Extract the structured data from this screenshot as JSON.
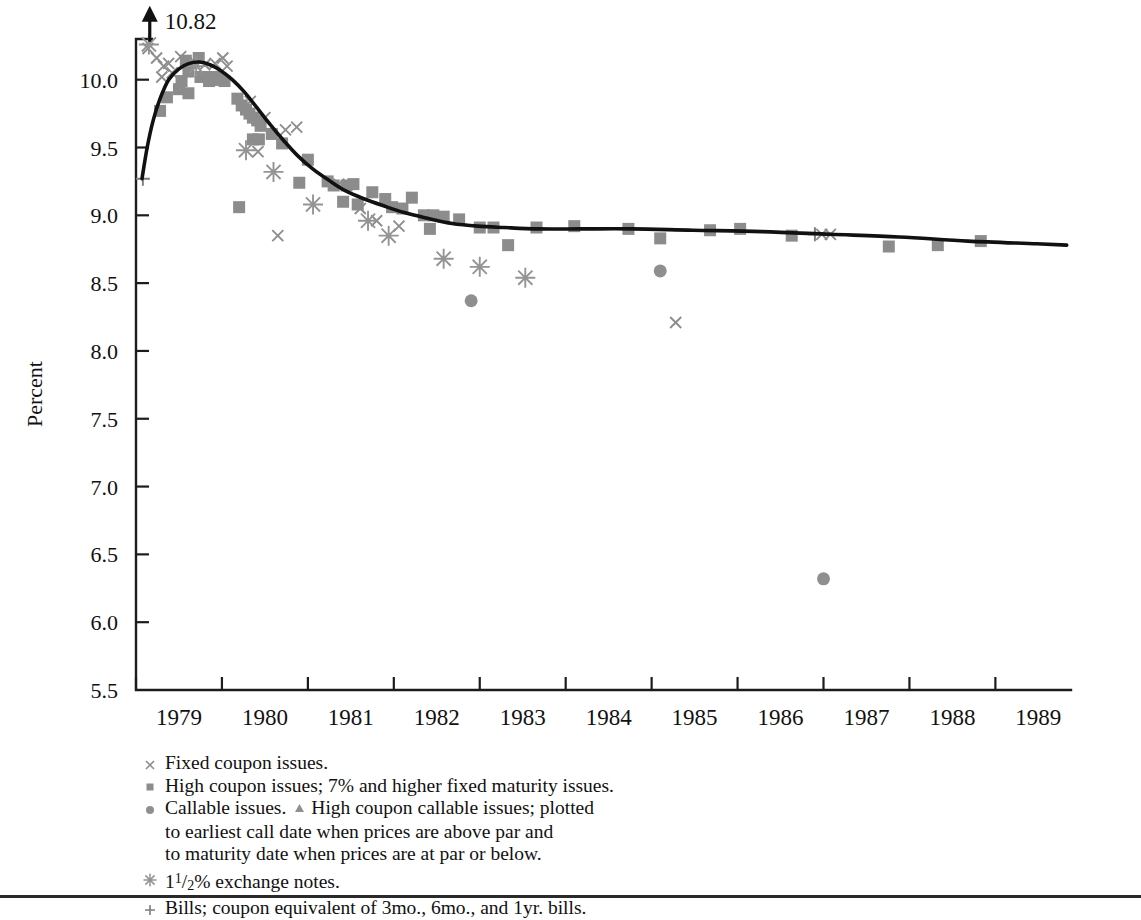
{
  "chart_data": {
    "type": "scatter",
    "title": "",
    "xlabel": "",
    "ylabel": "Percent",
    "xlim": [
      1978.72,
      1989.6
    ],
    "ylim": [
      5.5,
      10.3
    ],
    "yticks": [
      "10.0",
      "9.5",
      "9.0",
      "8.5",
      "8.0",
      "7.5",
      "7.0",
      "6.5",
      "6.0",
      "5.5"
    ],
    "ytick_values": [
      10.0,
      9.5,
      9.0,
      8.5,
      8.0,
      7.5,
      7.0,
      6.5,
      6.0,
      5.5
    ],
    "xticks": [
      "1979",
      "1980",
      "1981",
      "1982",
      "1983",
      "1984",
      "1985",
      "1986",
      "1987",
      "1988",
      "1989"
    ],
    "xtick_values": [
      1979,
      1980,
      1981,
      1982,
      1983,
      1984,
      1985,
      1986,
      1987,
      1988,
      1989
    ],
    "grid": false,
    "legend_position": "below-axes",
    "annotations": [
      {
        "name": "off-scale-arrow",
        "label": "10.82",
        "x": 1978.88,
        "y": 10.28,
        "direction": "up"
      }
    ],
    "fit_curve": {
      "name": "yield-curve-fit",
      "points": [
        [
          1978.79,
          9.27
        ],
        [
          1978.85,
          9.5
        ],
        [
          1978.92,
          9.7
        ],
        [
          1979.0,
          9.86
        ],
        [
          1979.1,
          10.0
        ],
        [
          1979.22,
          10.08
        ],
        [
          1979.34,
          10.12
        ],
        [
          1979.46,
          10.13
        ],
        [
          1979.58,
          10.11
        ],
        [
          1979.7,
          10.07
        ],
        [
          1979.84,
          10.0
        ],
        [
          1979.98,
          9.91
        ],
        [
          1980.12,
          9.8
        ],
        [
          1980.28,
          9.67
        ],
        [
          1980.44,
          9.55
        ],
        [
          1980.6,
          9.44
        ],
        [
          1980.78,
          9.34
        ],
        [
          1980.96,
          9.26
        ],
        [
          1981.16,
          9.18
        ],
        [
          1981.38,
          9.12
        ],
        [
          1981.6,
          9.07
        ],
        [
          1981.84,
          9.02
        ],
        [
          1982.1,
          8.98
        ],
        [
          1982.4,
          8.94
        ],
        [
          1982.7,
          8.92
        ],
        [
          1983.0,
          8.91
        ],
        [
          1983.4,
          8.9
        ],
        [
          1983.9,
          8.9
        ],
        [
          1984.5,
          8.9
        ],
        [
          1985.2,
          8.89
        ],
        [
          1986.0,
          8.88
        ],
        [
          1986.8,
          8.86
        ],
        [
          1987.6,
          8.84
        ],
        [
          1988.4,
          8.81
        ],
        [
          1989.2,
          8.79
        ],
        [
          1989.55,
          8.78
        ]
      ]
    },
    "series": [
      {
        "name": "Fixed coupon issues",
        "marker": "x",
        "color": "#8d8d8d",
        "points": [
          [
            1978.86,
            10.23
          ],
          [
            1978.96,
            10.16
          ],
          [
            1979.04,
            10.1
          ],
          [
            1979.1,
            10.12
          ],
          [
            1979.02,
            10.02
          ],
          [
            1979.14,
            10.05
          ],
          [
            1979.24,
            10.17
          ],
          [
            1979.35,
            10.12
          ],
          [
            1979.4,
            10.13
          ],
          [
            1979.52,
            10.11
          ],
          [
            1979.64,
            10.12
          ],
          [
            1979.73,
            10.16
          ],
          [
            1979.78,
            10.1
          ],
          [
            1980.05,
            9.84
          ],
          [
            1980.22,
            9.72
          ],
          [
            1980.14,
            9.47
          ],
          [
            1980.46,
            9.63
          ],
          [
            1980.59,
            9.65
          ],
          [
            1980.37,
            8.85
          ],
          [
            1981.08,
            9.23
          ],
          [
            1981.33,
            9.05
          ],
          [
            1981.52,
            8.96
          ],
          [
            1981.78,
            8.92
          ],
          [
            1985.0,
            8.21
          ],
          [
            1986.7,
            8.86
          ],
          [
            1986.8,
            8.86
          ]
        ]
      },
      {
        "name": "High coupon issues; 7% and higher fixed maturity issues",
        "marker": "square",
        "color": "#8c8c8c",
        "points": [
          [
            1979.0,
            9.77
          ],
          [
            1979.08,
            9.87
          ],
          [
            1979.3,
            10.14
          ],
          [
            1979.33,
            10.06
          ],
          [
            1979.25,
            9.99
          ],
          [
            1979.22,
            9.93
          ],
          [
            1979.45,
            10.16
          ],
          [
            1979.47,
            10.02
          ],
          [
            1979.53,
            10.02
          ],
          [
            1979.57,
            9.99
          ],
          [
            1979.62,
            10.0
          ],
          [
            1979.66,
            10.02
          ],
          [
            1979.7,
            10.0
          ],
          [
            1979.75,
            9.99
          ],
          [
            1979.33,
            9.9
          ],
          [
            1979.9,
            9.86
          ],
          [
            1979.95,
            9.81
          ],
          [
            1980.0,
            9.78
          ],
          [
            1980.04,
            9.75
          ],
          [
            1980.08,
            9.72
          ],
          [
            1980.13,
            9.7
          ],
          [
            1980.17,
            9.66
          ],
          [
            1980.08,
            9.56
          ],
          [
            1980.15,
            9.56
          ],
          [
            1980.3,
            9.6
          ],
          [
            1980.42,
            9.53
          ],
          [
            1979.92,
            9.06
          ],
          [
            1980.72,
            9.41
          ],
          [
            1980.62,
            9.24
          ],
          [
            1980.95,
            9.25
          ],
          [
            1981.02,
            9.22
          ],
          [
            1981.17,
            9.22
          ],
          [
            1981.25,
            9.23
          ],
          [
            1981.13,
            9.1
          ],
          [
            1981.3,
            9.08
          ],
          [
            1981.47,
            9.17
          ],
          [
            1981.62,
            9.12
          ],
          [
            1981.7,
            9.06
          ],
          [
            1981.82,
            9.05
          ],
          [
            1981.93,
            9.13
          ],
          [
            1982.07,
            9.0
          ],
          [
            1982.18,
            9.0
          ],
          [
            1982.3,
            8.99
          ],
          [
            1982.14,
            8.9
          ],
          [
            1982.48,
            8.97
          ],
          [
            1982.72,
            8.91
          ],
          [
            1982.88,
            8.91
          ],
          [
            1983.05,
            8.78
          ],
          [
            1983.38,
            8.91
          ],
          [
            1983.82,
            8.92
          ],
          [
            1984.45,
            8.9
          ],
          [
            1984.82,
            8.83
          ],
          [
            1985.4,
            8.89
          ],
          [
            1985.75,
            8.9
          ],
          [
            1986.35,
            8.85
          ],
          [
            1987.48,
            8.77
          ],
          [
            1988.05,
            8.78
          ],
          [
            1988.55,
            8.81
          ]
        ]
      },
      {
        "name": "Callable issues",
        "marker": "circle",
        "color": "#8f8f8f",
        "points": [
          [
            1982.62,
            8.37
          ],
          [
            1984.82,
            8.59
          ],
          [
            1986.72,
            6.32
          ]
        ]
      },
      {
        "name": "1 1/2% exchange notes",
        "marker": "star",
        "color": "#949494",
        "points": [
          [
            1978.87,
            10.26
          ],
          [
            1979.42,
            10.1
          ],
          [
            1980.0,
            9.48
          ],
          [
            1980.32,
            9.32
          ],
          [
            1980.78,
            9.08
          ],
          [
            1981.42,
            8.96
          ],
          [
            1981.66,
            8.85
          ],
          [
            1982.3,
            8.68
          ],
          [
            1982.72,
            8.62
          ],
          [
            1983.25,
            8.54
          ]
        ]
      },
      {
        "name": "Bills; coupon equivalent of 3mo., 6mo., and 1yr. bills",
        "marker": "plus",
        "color": "#7d7d7d",
        "points": [
          [
            1978.8,
            9.27
          ],
          [
            1986.62,
            8.86
          ]
        ]
      }
    ]
  },
  "axes": {
    "y_axis_title": "Percent"
  },
  "legend": {
    "rows": [
      {
        "symbol": "x-marker-icon",
        "text": "Fixed coupon issues."
      },
      {
        "symbol": "square-marker-icon",
        "text": "High coupon issues; 7% and higher fixed maturity issues."
      },
      {
        "symbol": "circle-marker-icon",
        "text_before": "Callable issues.",
        "inline_symbol": "triangle-marker-icon",
        "text_after": "High coupon callable issues; plotted",
        "continuation": [
          "to earliest call date when prices are above par and",
          "to maturity date when prices are at par or below."
        ]
      },
      {
        "symbol": "star-marker-icon",
        "prefix": "1",
        "frac_num": "1",
        "frac_den": "2",
        "text": "% exchange notes."
      },
      {
        "symbol": "plus-marker-icon",
        "text": "Bills; coupon equivalent of 3mo., 6mo., and 1yr. bills."
      }
    ]
  },
  "colors": {
    "marker_gray": "#8d8d8d",
    "curve_black": "#111111",
    "axis_black": "#1c1c1c",
    "background": "#ffffff"
  }
}
